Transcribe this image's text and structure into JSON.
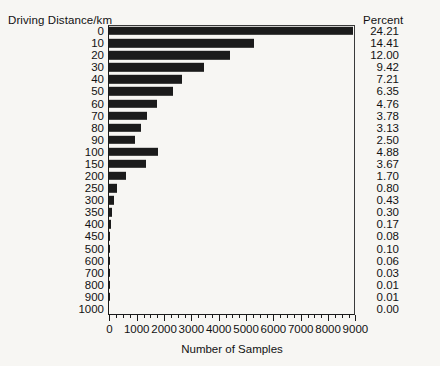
{
  "chart_data": {
    "type": "bar",
    "orientation": "horizontal",
    "title": "",
    "category_axis_title": "Driving Distance/km",
    "xlabel": "Number of Samples",
    "ylabel": "Driving Distance/km",
    "xlim": [
      0,
      9000
    ],
    "xticks": [
      0,
      1000,
      2000,
      3000,
      4000,
      5000,
      6000,
      7000,
      8000,
      9000
    ],
    "xtick_labels": [
      "0",
      "1000",
      "2000",
      "3000",
      "4000",
      "5000",
      "6000",
      "7000",
      "8000",
      "9000"
    ],
    "minor_tick_interval": 250,
    "grid": false,
    "legend": null,
    "bar_color": "#1b1b1b",
    "categories": [
      "0",
      "10",
      "20",
      "30",
      "40",
      "50",
      "60",
      "70",
      "80",
      "90",
      "100",
      "150",
      "200",
      "250",
      "300",
      "350",
      "400",
      "450",
      "500",
      "600",
      "700",
      "800",
      "900",
      "1000"
    ],
    "values": [
      8900,
      5300,
      4410,
      3460,
      2650,
      2335,
      1750,
      1390,
      1150,
      920,
      1795,
      1350,
      625,
      295,
      158,
      110,
      63,
      29,
      37,
      22,
      11,
      4,
      4,
      0
    ],
    "secondary_column": {
      "header": "Percent",
      "values": [
        "24.21",
        "14.41",
        "12.00",
        "9.42",
        "7.21",
        "6.35",
        "4.76",
        "3.78",
        "3.13",
        "2.50",
        "4.88",
        "3.67",
        "1.70",
        "0.80",
        "0.43",
        "0.30",
        "0.17",
        "0.08",
        "0.10",
        "0.06",
        "0.03",
        "0.01",
        "0.01",
        "0.00"
      ]
    }
  }
}
